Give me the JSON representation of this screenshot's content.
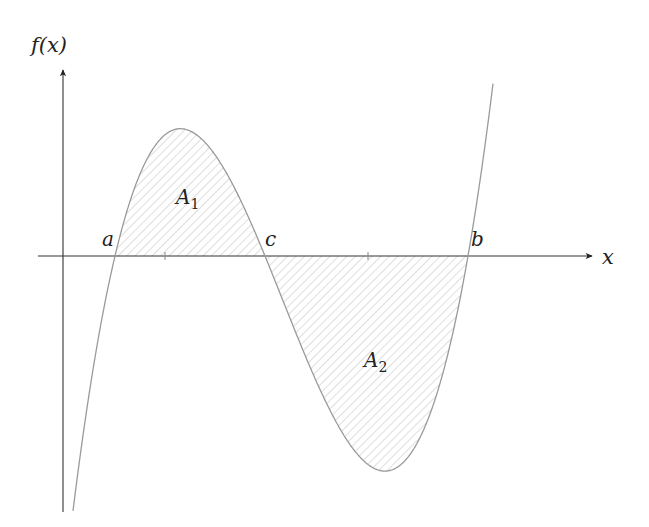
{
  "diagram": {
    "type": "function-area-plot",
    "axes": {
      "x_label": "x",
      "y_label": "f(x)",
      "axis_color": "#333333",
      "x_ticks_unlabeled": 2
    },
    "points": {
      "a": "a",
      "c": "c",
      "b": "b"
    },
    "regions": {
      "A1": {
        "letter": "A",
        "subscript": "1",
        "note": "area above x-axis between a and c"
      },
      "A2": {
        "letter": "A",
        "subscript": "2",
        "note": "area below x-axis between c and b"
      }
    },
    "curve": {
      "description": "cubic polynomial with roots a, c, b",
      "color": "#999999"
    },
    "hatch_color": "#d8d8d8"
  }
}
